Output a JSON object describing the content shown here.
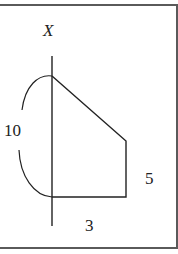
{
  "figure": {
    "axis": {
      "label": "X",
      "orientation": "vertical"
    },
    "shape": {
      "type": "right trapezoid rotated about axis",
      "vertices_px": [
        [
          52,
          76
        ],
        [
          126,
          141
        ],
        [
          126,
          197
        ],
        [
          52,
          197
        ]
      ]
    },
    "labels": {
      "arc_length": "10",
      "right_side": "5",
      "bottom_side": "3"
    },
    "colors": {
      "stroke": "#222222",
      "frame": "#5a5a5a",
      "background": "#ffffff"
    }
  }
}
